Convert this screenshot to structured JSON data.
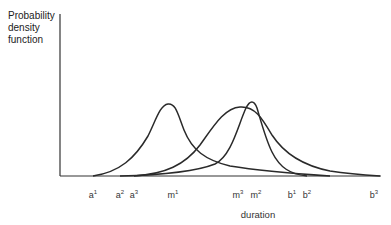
{
  "diagram": {
    "y_axis_label_lines": [
      "Probability",
      "density",
      "function"
    ],
    "x_axis_label": "duration",
    "ticks": [
      {
        "base": "a",
        "sup": "1",
        "x": 93
      },
      {
        "base": "a",
        "sup": "2",
        "x": 120
      },
      {
        "base": "a",
        "sup": "3",
        "x": 134
      },
      {
        "base": "m",
        "sup": "1",
        "x": 173
      },
      {
        "base": "m",
        "sup": "3",
        "x": 238
      },
      {
        "base": "m",
        "sup": "2",
        "x": 256
      },
      {
        "base": "b",
        "sup": "1",
        "x": 292
      },
      {
        "base": "b",
        "sup": "2",
        "x": 307
      },
      {
        "base": "b",
        "sup": "3",
        "x": 374
      }
    ],
    "curves": [
      {
        "name": "distribution-1",
        "start": "a1",
        "mode": "m1",
        "end": "b1"
      },
      {
        "name": "distribution-2",
        "start": "a2",
        "mode": "m2",
        "end": "b2"
      },
      {
        "name": "distribution-3",
        "start": "a3",
        "mode": "m3",
        "end": "b3"
      }
    ],
    "line_color": "#2a2a2a"
  }
}
